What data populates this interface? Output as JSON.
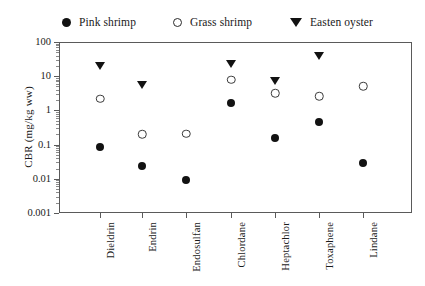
{
  "chart_data": {
    "type": "scatter",
    "title": "",
    "xlabel": "",
    "ylabel": "CBR (mg/kg ww)",
    "yscale": "log",
    "ylim": [
      0.001,
      100
    ],
    "ytick_labels": [
      "100",
      "10",
      "1",
      "0.1",
      "0.01",
      "0.001"
    ],
    "ytick_values": [
      100,
      10,
      1,
      0.1,
      0.01,
      0.001
    ],
    "grid": false,
    "legend_position": "top",
    "categories": [
      "Dieldrin",
      "Endrin",
      "Endosulfan",
      "Chlordane",
      "Heptachlor",
      "Toxaphene",
      "Lindane"
    ],
    "series": [
      {
        "name": "Pink shrimp",
        "marker": "filled-circle",
        "color": "#121212",
        "values": [
          0.085,
          0.024,
          0.0095,
          1.6,
          0.16,
          0.46,
          0.029
        ]
      },
      {
        "name": "Grass shrimp",
        "marker": "open-circle",
        "color": "#ffffff",
        "values": [
          2.2,
          0.2,
          0.21,
          8.0,
          3.2,
          2.6,
          5.0
        ]
      },
      {
        "name": "Easten oyster",
        "marker": "triangle-down",
        "color": "#121212",
        "values": [
          20,
          5.5,
          null,
          22,
          7.0,
          40,
          null
        ]
      }
    ]
  },
  "legend": {
    "entries": [
      {
        "label": "Pink shrimp",
        "marker": "filled-circle"
      },
      {
        "label": "Grass shrimp",
        "marker": "open-circle"
      },
      {
        "label": "Easten oyster",
        "marker": "triangle-down"
      }
    ]
  },
  "axes": {
    "y_title": "CBR (mg/kg ww)"
  }
}
